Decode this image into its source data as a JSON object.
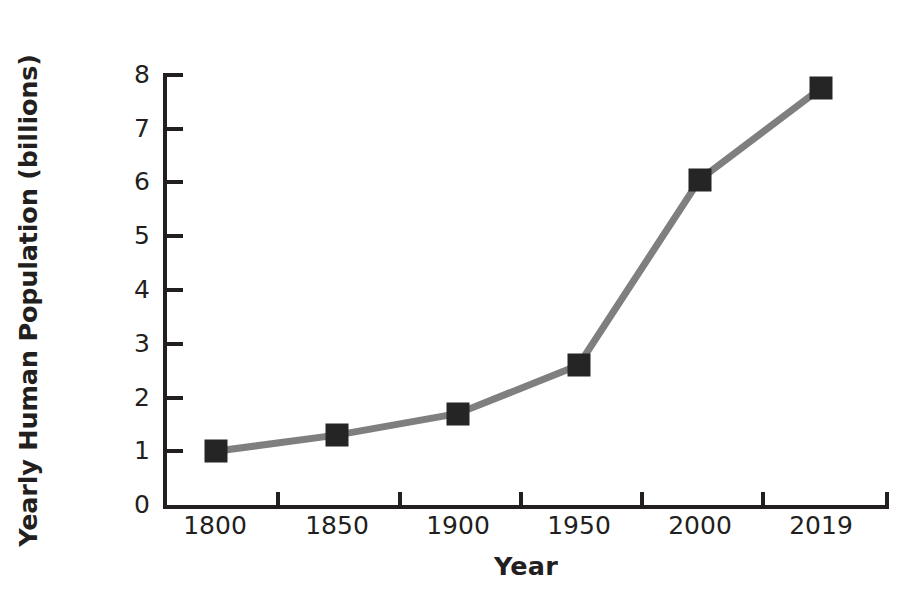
{
  "chart_data": {
    "type": "line",
    "title": "",
    "xlabel": "Year",
    "ylabel": "Yearly Human Population (billions)",
    "categories": [
      "1800",
      "1850",
      "1900",
      "1950",
      "2000",
      "2019"
    ],
    "values": [
      1.0,
      1.3,
      1.7,
      2.6,
      6.05,
      7.75
    ],
    "ylim": [
      0,
      8
    ],
    "yticks": [
      "8",
      "7",
      "6",
      "5",
      "4",
      "3",
      "2",
      "1",
      "0"
    ],
    "ytick_values": [
      8,
      7,
      6,
      5,
      4,
      3,
      2,
      1,
      0
    ],
    "grid": false,
    "legend": "none",
    "series": [
      {
        "name": "Yearly Human Population",
        "values": [
          1.0,
          1.3,
          1.7,
          2.6,
          6.05,
          7.75
        ]
      }
    ],
    "style": {
      "line_color": "#7f7f7f",
      "line_width": 7,
      "marker": "square",
      "marker_color": "#252525",
      "marker_size": 23,
      "axis_color": "#231f20",
      "background": "#ffffff"
    }
  }
}
